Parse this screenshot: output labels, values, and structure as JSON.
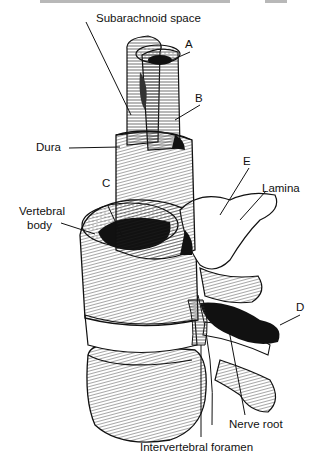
{
  "figure": {
    "labels": {
      "subarachnoid": "Subarachnoid space",
      "a": "A",
      "b": "B",
      "dura": "Dura",
      "e": "E",
      "c": "C",
      "lamina": "Lamina",
      "vertebral_line1": "Vertebral",
      "vertebral_line2": "body",
      "d": "D",
      "nerve_root": "Nerve root",
      "foramen": "Intervertebral foramen"
    }
  }
}
